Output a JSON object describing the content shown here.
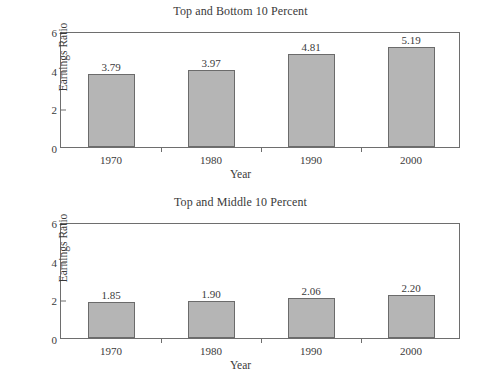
{
  "figure": {
    "background": "#ffffff",
    "bar_fill": "#b5b5b5",
    "bar_stroke": "#6b6b6b",
    "axis_stroke": "#6e6e6e",
    "text_color": "#3a3a3a"
  },
  "chart_data": [
    {
      "type": "bar",
      "title": "Top and Bottom 10 Percent",
      "xlabel": "Year",
      "ylabel": "Earnings Ratio",
      "categories": [
        "1970",
        "1980",
        "1990",
        "2000"
      ],
      "values": [
        3.79,
        3.97,
        4.81,
        5.19
      ],
      "labels": [
        "3.79",
        "3.97",
        "4.81",
        "5.19"
      ],
      "ylim": [
        0,
        6
      ],
      "yticks": [
        0,
        2,
        4,
        6
      ],
      "yticklabels": [
        "0",
        "2",
        "4",
        "6"
      ],
      "grid": false,
      "legend": false
    },
    {
      "type": "bar",
      "title": "Top and Middle 10 Percent",
      "xlabel": "Year",
      "ylabel": "Earnings Ratio",
      "categories": [
        "1970",
        "1980",
        "1990",
        "2000"
      ],
      "values": [
        1.85,
        1.9,
        2.06,
        2.2
      ],
      "labels": [
        "1.85",
        "1.90",
        "2.06",
        "2.20"
      ],
      "ylim": [
        0,
        6
      ],
      "yticks": [
        0,
        2,
        4,
        6
      ],
      "yticklabels": [
        "0",
        "2",
        "4",
        "6"
      ],
      "grid": false,
      "legend": false
    }
  ]
}
